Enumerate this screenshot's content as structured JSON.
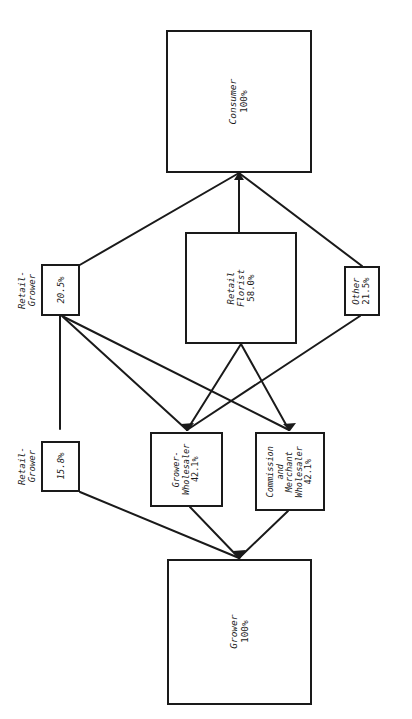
{
  "diagram": {
    "orientation": "text rotated 90 degrees counter-clockwise",
    "stroke_color": "#1a1a1a",
    "background_color": "#ffffff",
    "nodes": [
      {
        "id": "consumer",
        "label": "Consumer",
        "value": "100%",
        "label_position": "inside",
        "lines": [
          "Consumer"
        ]
      },
      {
        "id": "retail-grower-top",
        "label": "Retail-\nGrower",
        "value": "20.5%",
        "label_position": "outside",
        "lines": [
          "Retail-",
          "Grower"
        ]
      },
      {
        "id": "retail-florist",
        "label": "Retail Florist",
        "value": "58.0%",
        "label_position": "inside",
        "lines": [
          "Retail",
          "Florist"
        ]
      },
      {
        "id": "other",
        "label": "Other",
        "value": "21.5%",
        "label_position": "inside",
        "lines": [
          "Other"
        ]
      },
      {
        "id": "retail-grower-bottom",
        "label": "Retail-\nGrower",
        "value": "15.8%",
        "label_position": "outside",
        "lines": [
          "Retail-",
          "Grower"
        ]
      },
      {
        "id": "grower-wholesaler",
        "label": "Grower-Wholesaler",
        "value": "42.1%",
        "label_position": "inside",
        "lines": [
          "Grower-",
          "Wholesaler"
        ]
      },
      {
        "id": "commission-merchant-wholesaler",
        "label": "Commission and Merchant Wholesaler",
        "value": "42.1%",
        "label_position": "inside",
        "lines": [
          "Commission",
          "and",
          "Merchant",
          "Wholesaler"
        ]
      },
      {
        "id": "grower",
        "label": "Grower",
        "value": "100%",
        "label_position": "inside",
        "lines": [
          "Grower"
        ]
      }
    ],
    "edges": [
      {
        "from": "retail-grower-top",
        "to": "consumer"
      },
      {
        "from": "retail-florist",
        "to": "consumer"
      },
      {
        "from": "other",
        "to": "consumer"
      },
      {
        "from": "retail-grower-bottom",
        "to": "retail-grower-top"
      },
      {
        "from": "grower-wholesaler",
        "to": "retail-grower-top"
      },
      {
        "from": "commission-merchant-wholesaler",
        "to": "retail-grower-top"
      },
      {
        "from": "grower-wholesaler",
        "to": "retail-florist"
      },
      {
        "from": "commission-merchant-wholesaler",
        "to": "retail-florist"
      },
      {
        "from": "grower-wholesaler",
        "to": "other"
      },
      {
        "from": "grower",
        "to": "retail-grower-bottom"
      },
      {
        "from": "grower",
        "to": "grower-wholesaler"
      },
      {
        "from": "grower",
        "to": "commission-merchant-wholesaler"
      }
    ]
  }
}
